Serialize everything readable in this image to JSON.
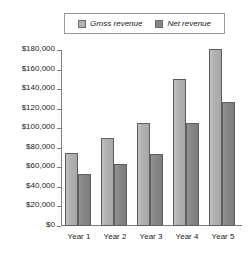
{
  "chart_data": {
    "type": "bar",
    "title": "",
    "xlabel": "",
    "ylabel": "",
    "categories": [
      "Year 1",
      "Year 2",
      "Year 3",
      "Year 4",
      "Year 5"
    ],
    "series": [
      {
        "name": "Gross revenue",
        "color": "#b0b0b0",
        "values": [
          75000,
          90000,
          105000,
          150000,
          181000
        ]
      },
      {
        "name": "Net revenue",
        "color": "#858585",
        "values": [
          53000,
          63000,
          74000,
          105000,
          127000
        ]
      }
    ],
    "ylim": [
      0,
      180000
    ],
    "ytick_values": [
      0,
      20000,
      40000,
      60000,
      80000,
      100000,
      120000,
      140000,
      160000,
      180000
    ],
    "ytick_labels": [
      "$0",
      "$20,000",
      "$40,000",
      "$60,000",
      "$80,000",
      "$100,000",
      "$120,000",
      "$140,000",
      "$160,000",
      "$180,000"
    ],
    "grid": false,
    "legend_position": "top"
  },
  "legend": {
    "entries": [
      {
        "label": "Gross revenue",
        "swatch": "gross-revenue-swatch"
      },
      {
        "label": "Net revenue",
        "swatch": "net-revenue-swatch"
      }
    ]
  }
}
